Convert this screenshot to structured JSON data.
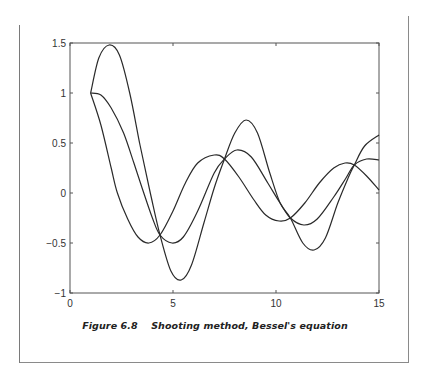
{
  "caption": {
    "figure_number": "Figure 6.8",
    "title": "Shooting method, Bessel's equation"
  },
  "chart_data": {
    "type": "line",
    "title": "Shooting method, Bessel's equation",
    "xlabel": "",
    "ylabel": "",
    "xlim": [
      0,
      15
    ],
    "ylim": [
      -1,
      1.5
    ],
    "xticks": [
      0,
      5,
      10,
      15
    ],
    "yticks": [
      -1,
      -0.5,
      0,
      0.5,
      1,
      1.5
    ],
    "xtick_labels": [
      "0",
      "5",
      "10",
      "15"
    ],
    "ytick_labels": [
      "−1",
      "−0.5",
      "0",
      "0.5",
      "1",
      "1.5"
    ],
    "grid": false,
    "legend": null,
    "line_color": "#2a2a2a",
    "series": [
      {
        "name": "trial 1",
        "x": [
          1,
          1.5,
          2,
          2.3,
          2.8,
          3.3,
          3.83,
          4.37,
          5,
          5.6,
          6.2,
          7.0,
          7.5,
          8.2,
          8.9,
          9.5,
          10.15,
          10.7,
          11.4,
          12.1,
          12.8,
          13.35,
          13.8,
          14.4,
          15
        ],
        "y": [
          1,
          0.68,
          0.25,
          0.0,
          -0.26,
          -0.44,
          -0.5,
          -0.42,
          -0.18,
          0.1,
          0.3,
          0.38,
          0.34,
          0.16,
          -0.06,
          -0.22,
          -0.28,
          -0.25,
          -0.1,
          0.1,
          0.25,
          0.3,
          0.28,
          0.17,
          0.03
        ]
      },
      {
        "name": "trial 2",
        "x": [
          1,
          1.5,
          2,
          2.6,
          3.1,
          3.5,
          4.0,
          4.37,
          4.95,
          5.5,
          6.2,
          7.0,
          7.5,
          8.1,
          8.8,
          9.6,
          10.2,
          10.7,
          11.35,
          12.0,
          12.8,
          13.4,
          13.8,
          14.4,
          15
        ],
        "y": [
          1,
          0.98,
          0.85,
          0.6,
          0.3,
          0.05,
          -0.25,
          -0.42,
          -0.5,
          -0.44,
          -0.18,
          0.2,
          0.34,
          0.43,
          0.36,
          0.1,
          -0.1,
          -0.25,
          -0.32,
          -0.26,
          -0.04,
          0.15,
          0.28,
          0.34,
          0.33
        ]
      },
      {
        "name": "trial 3",
        "x": [
          1,
          1.4,
          1.9,
          2.4,
          2.9,
          3.4,
          3.9,
          4.37,
          4.9,
          5.4,
          5.9,
          6.5,
          7.0,
          7.5,
          8.0,
          8.55,
          9.1,
          9.7,
          10.2,
          10.7,
          11.3,
          11.85,
          12.4,
          13.0,
          13.5,
          13.8,
          14.3,
          15
        ],
        "y": [
          1,
          1.35,
          1.48,
          1.38,
          1.0,
          0.48,
          0.0,
          -0.42,
          -0.78,
          -0.87,
          -0.72,
          -0.3,
          0.05,
          0.34,
          0.6,
          0.73,
          0.6,
          0.2,
          -0.1,
          -0.25,
          -0.5,
          -0.57,
          -0.45,
          -0.1,
          0.15,
          0.28,
          0.47,
          0.58
        ]
      }
    ]
  }
}
